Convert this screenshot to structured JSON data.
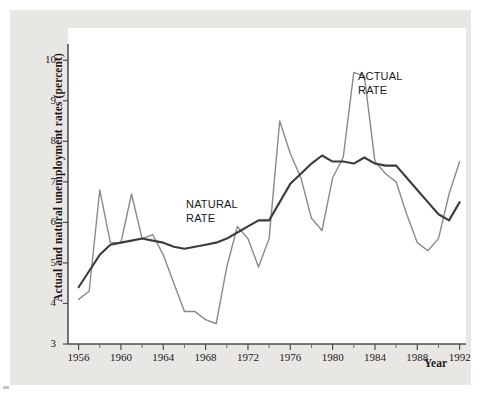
{
  "figure": {
    "y_axis_title": "Actual and\nnatural unemployment rates (percent)",
    "x_axis_title": "Year",
    "series_label_natural": "NATURAL\nRATE",
    "series_label_actual": "ACTUAL\nRATE",
    "colors": {
      "backdrop": "#e9e7e3",
      "plot_background": "#ffffff",
      "axis": "#4a4a4c",
      "natural_rate_line": "#3b3b40",
      "actual_rate_line": "#8a8a8e"
    }
  },
  "chart_data": {
    "type": "line",
    "title": "",
    "subtitle": "",
    "xlabel": "Year",
    "ylabel": "Actual and natural unemployment rates (percent)",
    "xlim": [
      1955,
      1992.6
    ],
    "ylim": [
      3,
      10.4
    ],
    "grid": false,
    "legend_position": "inline-annotation",
    "y_ticks": [
      3,
      4,
      5,
      6,
      7,
      8,
      9,
      10
    ],
    "y_tick_labels": [
      "3",
      "4",
      "5",
      "6",
      "7",
      "8",
      "9",
      "10"
    ],
    "x_ticks_major": [
      1956,
      1960,
      1964,
      1968,
      1972,
      1976,
      1980,
      1984,
      1988,
      1992
    ],
    "x_tick_labels": [
      "1956",
      "1960",
      "1964",
      "1968",
      "1972",
      "1976",
      "1980",
      "1984",
      "1988",
      "1992"
    ],
    "x_ticks_minor": [
      1958,
      1962,
      1966,
      1970,
      1974,
      1978,
      1982,
      1986,
      1990
    ],
    "x": [
      1956,
      1957,
      1958,
      1959,
      1960,
      1961,
      1962,
      1963,
      1964,
      1965,
      1966,
      1967,
      1968,
      1969,
      1970,
      1971,
      1972,
      1973,
      1974,
      1975,
      1976,
      1977,
      1978,
      1979,
      1980,
      1981,
      1982,
      1983,
      1984,
      1985,
      1986,
      1987,
      1988,
      1989,
      1990,
      1991,
      1992
    ],
    "series": [
      {
        "name": "ACTUAL RATE",
        "color": "#8a8a8e",
        "line_width": 1.4,
        "values": [
          4.1,
          4.3,
          6.8,
          5.5,
          5.5,
          6.7,
          5.6,
          5.7,
          5.2,
          4.5,
          3.8,
          3.8,
          3.6,
          3.5,
          4.9,
          5.9,
          5.6,
          4.9,
          5.6,
          8.5,
          7.7,
          7.1,
          6.1,
          5.8,
          7.1,
          7.6,
          9.7,
          9.6,
          7.5,
          7.2,
          7.0,
          6.2,
          5.5,
          5.3,
          5.6,
          6.7,
          7.5
        ]
      },
      {
        "name": "NATURAL RATE",
        "color": "#3b3b40",
        "line_width": 2.1,
        "values": [
          4.4,
          4.8,
          5.2,
          5.45,
          5.5,
          5.55,
          5.6,
          5.55,
          5.5,
          5.4,
          5.35,
          5.4,
          5.45,
          5.5,
          5.6,
          5.75,
          5.9,
          6.05,
          6.05,
          6.5,
          6.95,
          7.2,
          7.45,
          7.65,
          7.5,
          7.5,
          7.45,
          7.6,
          7.45,
          7.4,
          7.4,
          7.1,
          6.8,
          6.5,
          6.2,
          6.05,
          6.5
        ]
      }
    ],
    "annotations": [
      {
        "text": "NATURAL RATE",
        "x": 1966.5,
        "y": 6.45
      },
      {
        "text": "ACTUAL RATE",
        "x": 1983.0,
        "y": 9.45
      }
    ]
  }
}
